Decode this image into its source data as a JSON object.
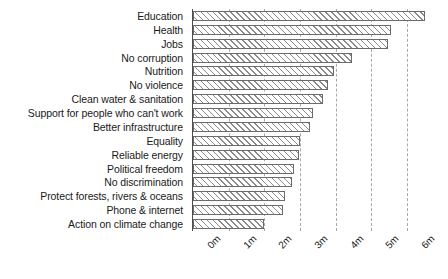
{
  "chart_data": {
    "type": "bar",
    "orientation": "horizontal",
    "title": "",
    "subtitle": "",
    "xlabel": "",
    "ylabel": "",
    "xlim": [
      0,
      6.95
    ],
    "xticks": [
      0,
      1,
      2,
      3,
      4,
      5,
      6
    ],
    "xticklabels": [
      "0m",
      "1m",
      "2m",
      "3m",
      "4m",
      "5m",
      "6m"
    ],
    "grid": "vertical-dashed",
    "legend": "none",
    "categories": [
      "Education",
      "Health",
      "Jobs",
      "No corruption",
      "Nutrition",
      "No violence",
      "Clean water & sanitation",
      "Support for people who can't work",
      "Better infrastructure",
      "Equality",
      "Reliable energy",
      "Political freedom",
      "No discrimination",
      "Protect forests, rivers & oceans",
      "Phone & internet",
      "Action on climate change"
    ],
    "values": [
      6.5,
      5.56,
      5.47,
      4.45,
      3.96,
      3.78,
      3.64,
      3.37,
      3.28,
      2.99,
      2.96,
      2.82,
      2.78,
      2.58,
      2.53,
      2.0
    ],
    "units": "millions of votes",
    "bar_style": {
      "fill": "#e6e6e6",
      "hatch": "///",
      "edge": "#6b6b6b"
    }
  }
}
